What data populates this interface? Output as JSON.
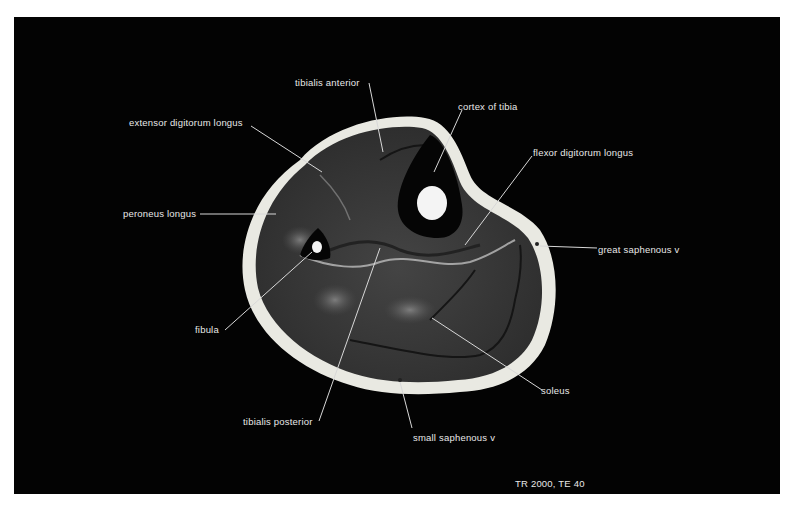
{
  "figure": {
    "type": "axial MRI cross-section of the lower leg",
    "sequence_label": "TR 2000, TE 40",
    "colors": {
      "background": "#030303",
      "page": "#ffffff",
      "label_text": "#e8e8e8",
      "subcutaneous_fat": "#e9e9e2",
      "muscle": "#3a3a3a",
      "cortical_bone": "#050505",
      "marrow": "#f4f4f4"
    }
  },
  "labels": [
    {
      "id": "tibialis-anterior",
      "text": "tibialis anterior",
      "x": 243,
      "y": 77
    },
    {
      "id": "cortex-of-tibia",
      "text": "cortex of tibia",
      "x": 458,
      "y": 101
    },
    {
      "id": "extensor-digitorum-longus",
      "text": "extensor digitorum longus",
      "x": 129,
      "y": 117
    },
    {
      "id": "flexor-digitorum-longus",
      "text": "flexor digitorum longus",
      "x": 533,
      "y": 147
    },
    {
      "id": "peroneus-longus",
      "text": "peroneus longus",
      "x": 123,
      "y": 208
    },
    {
      "id": "great-saphenous-v",
      "text": "great saphenous v",
      "x": 598,
      "y": 244
    },
    {
      "id": "fibula",
      "text": "fibula",
      "x": 195,
      "y": 324
    },
    {
      "id": "soleus",
      "text": "soleus",
      "x": 545,
      "y": 386
    },
    {
      "id": "tibialis-posterior",
      "text": "tibialis posterior",
      "x": 243,
      "y": 416
    },
    {
      "id": "small-saphenous-v",
      "text": "small saphenous v",
      "x": 417,
      "y": 432
    }
  ]
}
